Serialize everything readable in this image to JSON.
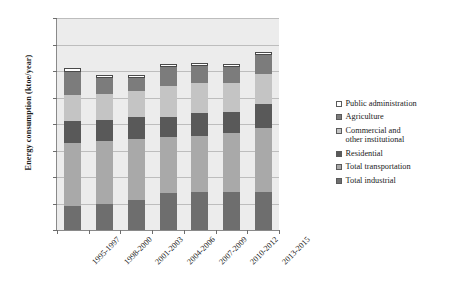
{
  "chart_data": {
    "type": "bar",
    "subtype": "stacked-column",
    "title": "",
    "xlabel": "",
    "ylabel": "Energy consumption (ktoe/year)",
    "ylim": [
      0,
      8000
    ],
    "ytick_step": 1000,
    "ytick_labels": [
      "8,000",
      "7,000",
      "6,000",
      "5,000",
      "4,000",
      "3,000",
      "2,000",
      "1,000",
      "0"
    ],
    "grid": true,
    "legend_position": "right",
    "categories": [
      "1995-1997",
      "1998-2000",
      "2001-2003",
      "2004-2006",
      "2007-2009",
      "2010-2012",
      "2013-2015"
    ],
    "series": [
      {
        "name": "Total industrial",
        "color": "#6e6e6e",
        "values": [
          900,
          1000,
          1150,
          1400,
          1450,
          1450,
          1450
        ]
      },
      {
        "name": "Total transportation",
        "color": "#a9a9a9",
        "values": [
          2400,
          2350,
          2300,
          2100,
          2100,
          2200,
          2400
        ]
      },
      {
        "name": "Residential",
        "color": "#595959",
        "values": [
          800,
          800,
          800,
          750,
          850,
          800,
          900
        ]
      },
      {
        "name": "Commercial and\nother institutional",
        "color": "#c4c4c4",
        "values": [
          1000,
          1000,
          1000,
          1200,
          1150,
          1100,
          1150
        ]
      },
      {
        "name": "Agriculture",
        "color": "#7c7c7c",
        "values": [
          850,
          600,
          500,
          700,
          650,
          600,
          700
        ]
      },
      {
        "name": "Public administration",
        "color": "#ffffff",
        "values": [
          150,
          100,
          100,
          100,
          100,
          100,
          100
        ]
      }
    ],
    "totals": [
      6100,
      5850,
      5850,
      6250,
      6300,
      6250,
      6700
    ]
  },
  "legend": {
    "items": [
      {
        "label": "Public administration",
        "color": "#ffffff"
      },
      {
        "label": "Agriculture",
        "color": "#7c7c7c"
      },
      {
        "label": "Commercial and\nother institutional",
        "color": "#c4c4c4"
      },
      {
        "label": "Residential",
        "color": "#595959"
      },
      {
        "label": "Total transportation",
        "color": "#a9a9a9"
      },
      {
        "label": "Total industrial",
        "color": "#6e6e6e"
      }
    ]
  }
}
